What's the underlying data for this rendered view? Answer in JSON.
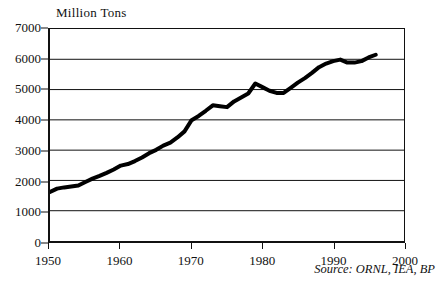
{
  "chart_data": {
    "type": "line",
    "title": "Million Tons",
    "xlabel": "",
    "ylabel": "Million Tons",
    "xlim": [
      1950,
      2000
    ],
    "ylim": [
      0,
      7000
    ],
    "grid": true,
    "legend": null,
    "annotation": "Source: ORNL, IEA, BP",
    "xticks": [
      1950,
      1960,
      1970,
      1980,
      1990,
      2000
    ],
    "yticks": [
      0,
      1000,
      2000,
      3000,
      4000,
      5000,
      6000,
      7000
    ],
    "series": [
      {
        "name": "Million Tons",
        "color": "#000000",
        "x": [
          1950,
          1951,
          1952,
          1953,
          1954,
          1955,
          1956,
          1957,
          1958,
          1959,
          1960,
          1961,
          1962,
          1963,
          1964,
          1965,
          1966,
          1967,
          1968,
          1969,
          1970,
          1971,
          1972,
          1973,
          1974,
          1975,
          1976,
          1977,
          1978,
          1979,
          1980,
          1981,
          1982,
          1983,
          1984,
          1985,
          1986,
          1987,
          1988,
          1989,
          1990,
          1991,
          1992,
          1993,
          1994,
          1995,
          1996
        ],
        "values": [
          1620,
          1730,
          1770,
          1800,
          1830,
          1950,
          2060,
          2150,
          2250,
          2360,
          2490,
          2540,
          2640,
          2760,
          2900,
          3010,
          3150,
          3250,
          3420,
          3620,
          3990,
          4130,
          4300,
          4480,
          4450,
          4420,
          4610,
          4740,
          4870,
          5200,
          5080,
          4960,
          4890,
          4890,
          5060,
          5230,
          5380,
          5550,
          5740,
          5860,
          5940,
          5990,
          5890,
          5890,
          5940,
          6060,
          6150
        ]
      }
    ]
  },
  "axis": {
    "y_tick_labels": [
      "7000",
      "6000",
      "5000",
      "4000",
      "3000",
      "2000",
      "1000",
      "0"
    ],
    "x_tick_labels": [
      "1950",
      "1960",
      "1970",
      "1980",
      "1990",
      "2000"
    ]
  }
}
